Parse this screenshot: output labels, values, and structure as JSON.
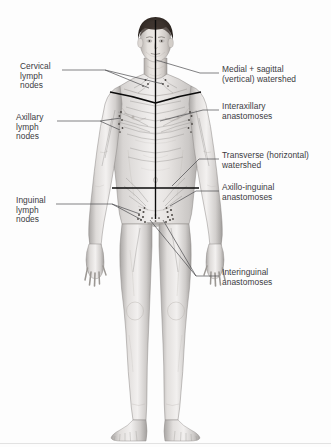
{
  "figure": {
    "background_color": "#fdfdfd",
    "line_color": "#000000",
    "label_color": "#3b3b3f",
    "leader_color": "#4a4a4e",
    "skin_light": "#f2f0ef",
    "skin_mid": "#cdcac8",
    "skin_shadow": "#9c9997",
    "hair_color": "#2b2522"
  },
  "labels": {
    "left": [
      {
        "id": "cervical",
        "lines": [
          "Cervical",
          "lymph",
          "nodes"
        ],
        "x": 20,
        "y": 66
      },
      {
        "id": "axillary",
        "lines": [
          "Axillary",
          "lymph",
          "nodes"
        ],
        "x": 16,
        "y": 117
      },
      {
        "id": "inguinal",
        "lines": [
          "Inguinal",
          "lymph",
          "nodes"
        ],
        "x": 16,
        "y": 200
      }
    ],
    "right": [
      {
        "id": "medial-sagittal-watershed",
        "lines": [
          "Medial + sagittal",
          "(vertical) watershed"
        ],
        "x": 222,
        "y": 69
      },
      {
        "id": "interaxillary-anastomoses",
        "lines": [
          "Interaxillary",
          "anastomoses"
        ],
        "x": 222,
        "y": 106
      },
      {
        "id": "transverse-watershed",
        "lines": [
          "Transverse (horizontal)",
          "watershed"
        ],
        "x": 222,
        "y": 155
      },
      {
        "id": "axillo-inguinal-anastomoses",
        "lines": [
          "Axillo-inguinal",
          "anastomoses"
        ],
        "x": 222,
        "y": 187
      },
      {
        "id": "interinguinal-anastomoses",
        "lines": [
          "Interinguinal",
          "anastomoses"
        ],
        "x": 222,
        "y": 272
      }
    ]
  },
  "anatomy_markers": {
    "vertical_watershed": "median sagittal line from head to pubis",
    "transverse_watershed": "horizontal line across waist",
    "clavicular_watershed": "V-shaped lines over clavicles",
    "node_clusters": [
      "cervical",
      "axillary-left",
      "axillary-right",
      "inguinal-left",
      "inguinal-right"
    ]
  }
}
